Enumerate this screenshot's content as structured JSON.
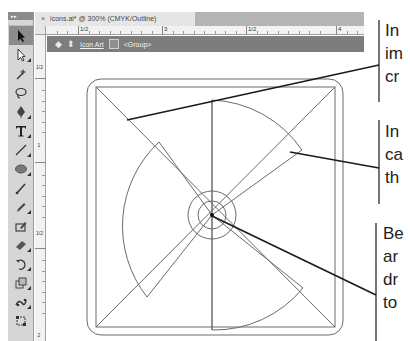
{
  "window": {
    "document_tab": "icons.ai* @ 300% (CMYK/Outline)",
    "close_glyph": "×"
  },
  "rulers": {
    "top_labels": [
      "1/2",
      "3",
      "1/2",
      "4"
    ],
    "left_labels": [
      "1/2",
      "1",
      "1/2",
      "2"
    ]
  },
  "isolation_bar": {
    "back_icon": "back-arrow-icon",
    "layer_icon": "layers-icon",
    "layer_label": "Icon Art",
    "group_icon": "group-icon",
    "group_label": "<Group>"
  },
  "tools": [
    {
      "name": "selection-tool",
      "active": true
    },
    {
      "name": "direct-selection-tool",
      "active": false
    },
    {
      "name": "magic-wand-tool",
      "active": false
    },
    {
      "name": "lasso-tool",
      "active": false
    },
    {
      "name": "pen-tool",
      "active": false
    },
    {
      "name": "type-tool",
      "active": false
    },
    {
      "name": "line-segment-tool",
      "active": false
    },
    {
      "name": "ellipse-tool",
      "active": false
    },
    {
      "name": "paintbrush-tool",
      "active": false
    },
    {
      "name": "pencil-tool",
      "active": false
    },
    {
      "name": "blob-brush-tool",
      "active": false
    },
    {
      "name": "eraser-tool",
      "active": false
    },
    {
      "name": "rotate-tool",
      "active": false
    },
    {
      "name": "scale-tool",
      "active": false
    },
    {
      "name": "puppet-warp-tool",
      "active": false
    },
    {
      "name": "free-transform-tool",
      "active": false
    }
  ],
  "callouts": [
    {
      "lines": [
        "In",
        "im",
        "cr"
      ]
    },
    {
      "lines": [
        "In",
        "ca",
        "th"
      ]
    },
    {
      "lines": [
        "Be",
        "ar",
        "dr",
        "to"
      ]
    }
  ],
  "colors": {
    "toolbar_bg": "#d6d6d6",
    "isolation_bar_bg": "#7d7d7d",
    "tab_bar_bg": "#b4b4b4",
    "outline_stroke": "#6a6a6a",
    "callout_stroke": "#1a1a1a"
  }
}
